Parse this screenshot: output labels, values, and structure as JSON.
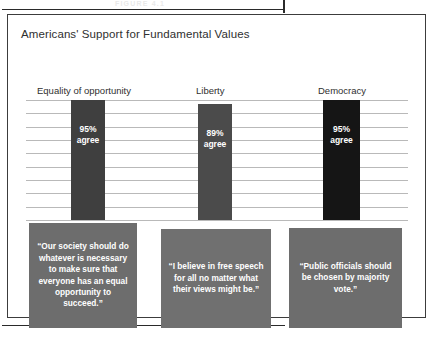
{
  "page": {
    "running_head": "FIGURE 4.1"
  },
  "figure": {
    "title": "Americans' Support for Fundamental Values"
  },
  "chart_data": {
    "type": "bar",
    "title": "Americans' Support for Fundamental Values",
    "xlabel": "",
    "ylabel": "",
    "ylim": [
      0,
      100
    ],
    "grid": true,
    "gridline_count": 10,
    "legend": "none",
    "categories": [
      "Equality of opportunity",
      "Liberty",
      "Democracy"
    ],
    "values": [
      95,
      89,
      95
    ],
    "value_labels": [
      "95%",
      "89%",
      "95%"
    ],
    "value_sublabels": [
      "agree",
      "agree",
      "agree"
    ],
    "bar_colors": [
      "#3f3f3f",
      "#4b4b4b",
      "#151515"
    ],
    "quotes": [
      "“Our society should do whatever is necessary to make sure that everyone has an equal opportunity to succeed.”",
      "“I believe in free speech for all no matter what their views might be.”",
      "“Public officials should be chosen by majority vote.”"
    ],
    "quote_colors": [
      "#6d6d6d",
      "#707070",
      "#6d6d6d"
    ]
  },
  "colors": {
    "frame": "#3c3c3c",
    "gridline": "#b9b9b9",
    "background": "#ffffff",
    "text": "#2f2f2f"
  }
}
